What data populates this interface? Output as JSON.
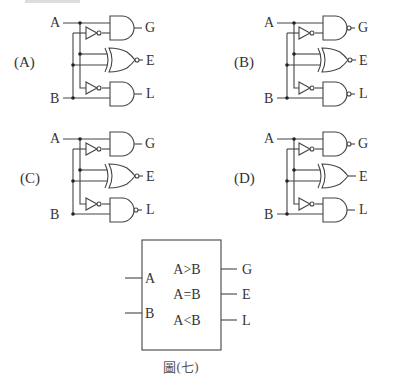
{
  "top_text_fragment": "答題說明：",
  "options": [
    {
      "id": "A",
      "label": "(A)",
      "input_a": "A",
      "input_b": "B",
      "gates": {
        "G": "AND",
        "E": "XNOR",
        "L": "AND"
      },
      "outputs": {
        "G": "G",
        "E": "E",
        "L": "L"
      }
    },
    {
      "id": "B",
      "label": "(B)",
      "input_a": "A",
      "input_b": "B",
      "gates": {
        "G": "NAND",
        "E": "XNOR",
        "L": "NAND"
      },
      "outputs": {
        "G": "G",
        "E": "E",
        "L": "L"
      }
    },
    {
      "id": "C",
      "label": "(C)",
      "input_a": "A",
      "input_b": "B",
      "gates": {
        "G": "AND",
        "E": "XNOR",
        "L": "NAND"
      },
      "outputs": {
        "G": "G",
        "E": "E",
        "L": "L"
      }
    },
    {
      "id": "D",
      "label": "(D)",
      "input_a": "A",
      "input_b": "B",
      "gates": {
        "G": "NAND",
        "E": "XOR",
        "L": "AND"
      },
      "outputs": {
        "G": "G",
        "E": "E",
        "L": "L"
      }
    }
  ],
  "block": {
    "inputs": [
      "A",
      "B"
    ],
    "ports": [
      "A>B",
      "A=B",
      "A<B"
    ],
    "outputs": [
      "G",
      "E",
      "L"
    ],
    "caption": "圖(七)"
  }
}
